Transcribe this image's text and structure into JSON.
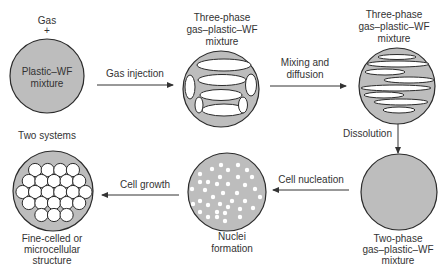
{
  "diagram": {
    "colors": {
      "background": "#ffffff",
      "disc_fill": "#bdbdbd",
      "outline": "#2b2b2b",
      "text": "#333333",
      "bubble": "#ffffff"
    },
    "stages": [
      {
        "id": "plastic-wf-mixture",
        "top_label": [
          "Gas",
          "+"
        ],
        "inner_label": [
          "Plastic–WF",
          "mixture"
        ],
        "bottom_label": [
          "Two systems"
        ]
      },
      {
        "id": "three-phase-after-injection",
        "top_label": [
          "Three-phase",
          "gas–plastic–WF",
          "mixture"
        ]
      },
      {
        "id": "three-phase-after-mixing",
        "top_label": [
          "Three-phase",
          "gas–plastic–WF",
          "mixture"
        ]
      },
      {
        "id": "two-phase-mixture",
        "bottom_label": [
          "Two-phase",
          "gas–plastic–WF",
          "mixture"
        ]
      },
      {
        "id": "nuclei-formation",
        "bottom_label": [
          "Nuclei",
          "formation"
        ]
      },
      {
        "id": "fine-celled-structure",
        "bottom_label": [
          "Fine-celled or",
          "microcellular",
          "structure"
        ]
      }
    ],
    "arrows": [
      {
        "from": "plastic-wf-mixture",
        "to": "three-phase-after-injection",
        "label": [
          "Gas injection"
        ]
      },
      {
        "from": "three-phase-after-injection",
        "to": "three-phase-after-mixing",
        "label": [
          "Mixing and",
          "diffusion"
        ]
      },
      {
        "from": "three-phase-after-mixing",
        "to": "two-phase-mixture",
        "label": [
          "Dissolution"
        ]
      },
      {
        "from": "two-phase-mixture",
        "to": "nuclei-formation",
        "label": [
          "Cell nucleation"
        ]
      },
      {
        "from": "nuclei-formation",
        "to": "fine-celled-structure",
        "label": [
          "Cell growth"
        ]
      }
    ]
  }
}
